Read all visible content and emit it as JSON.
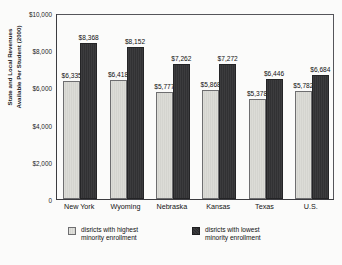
{
  "chart_data": {
    "type": "bar",
    "title": "",
    "xlabel": "",
    "ylabel": "State and Local Revenues Available Per Student (2000)",
    "ylabel_lines": [
      "State and Local Revenues",
      "Available Per Student (2000)"
    ],
    "ylim": [
      0,
      10000
    ],
    "ytick_labels": [
      "$10,000",
      "$8,000",
      "$6,000",
      "$4,000",
      "$2,000",
      "0"
    ],
    "ytick_values": [
      10000,
      8000,
      6000,
      4000,
      2000,
      0
    ],
    "grid": false,
    "legend_position": "bottom",
    "categories": [
      "New York",
      "Wyoming",
      "Nebraska",
      "Kansas",
      "Texas",
      "U.S."
    ],
    "series": [
      {
        "name": "disricts with highest minority enrollment",
        "name_lines": [
          "disricts with highest",
          "minority enrollment"
        ],
        "color": "#d8d8d3",
        "values": [
          6335,
          6418,
          5777,
          5868,
          5378,
          5782
        ],
        "labels": [
          "$6,335",
          "$6,418",
          "$5,777",
          "$5,868",
          "$5,378",
          "$5,782"
        ]
      },
      {
        "name": "disricts with lowest minority enrollment",
        "name_lines": [
          "disricts with lowest",
          "minority enrollment"
        ],
        "color": "#343436",
        "values": [
          8368,
          8152,
          7262,
          7272,
          6446,
          6684
        ],
        "labels": [
          "$8,368",
          "$8,152",
          "$7,262",
          "$7,272",
          "$6,446",
          "$6,684"
        ]
      }
    ]
  },
  "colors": {
    "background": "#fbfbfa",
    "frame": "#55555a",
    "text": "#121212",
    "series_light": "#d8d8d3",
    "series_dark": "#343436"
  }
}
